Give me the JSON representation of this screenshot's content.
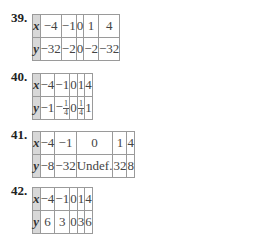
{
  "problems": [
    {
      "number": "39.",
      "x_label": "x",
      "y_label": "y",
      "x": [
        "−4",
        "−1",
        "0",
        "1",
        "4"
      ],
      "y": [
        "−32",
        "−2",
        "0",
        "−2",
        "−32"
      ]
    },
    {
      "number": "40.",
      "x_label": "x",
      "y_label": "y",
      "x": [
        "−4",
        "−1",
        "0",
        "1",
        "4"
      ],
      "y": [
        "−1",
        "−1/4",
        "0",
        "1/4",
        "1"
      ],
      "y_display": {
        "c0": "−1",
        "c1_sign": "−",
        "c1_num": "1",
        "c1_den": "4",
        "c2": "0",
        "c3_num": "1",
        "c3_den": "4",
        "c4": "1"
      }
    },
    {
      "number": "41.",
      "x_label": "x",
      "y_label": "y",
      "x": [
        "−4",
        "−1",
        "0",
        "1",
        "4"
      ],
      "y": [
        "−8",
        "−32",
        "Undef.",
        "32",
        "8"
      ]
    },
    {
      "number": "42.",
      "x_label": "x",
      "y_label": "y",
      "x": [
        "−4",
        "−1",
        "0",
        "1",
        "4"
      ],
      "y": [
        "6",
        "3",
        "0",
        "3",
        "6"
      ]
    }
  ]
}
